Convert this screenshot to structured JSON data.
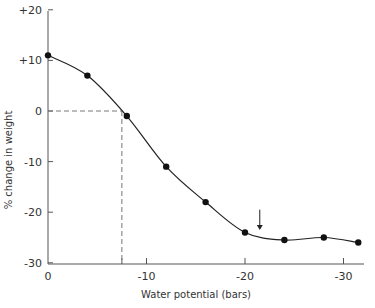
{
  "chart_data": {
    "type": "line",
    "title": "",
    "xlabel": "Water potential (bars)",
    "ylabel": "% change in weight",
    "xlim": [
      0,
      -32
    ],
    "ylim": [
      -30,
      20
    ],
    "grid": false,
    "legend": null,
    "x_ticks": [
      0,
      -10,
      -20,
      -30
    ],
    "x_tick_labels": [
      "0",
      "-10",
      "-20",
      "-30"
    ],
    "y_ticks": [
      20,
      10,
      0,
      -10,
      -20,
      -30
    ],
    "y_tick_labels": [
      "+20",
      "+10",
      "0",
      "-10",
      "-20",
      "-30"
    ],
    "series": [
      {
        "name": "measured",
        "marker": "filled-circle",
        "x": [
          0,
          -4,
          -8,
          -12,
          -16,
          -20,
          -24,
          -28,
          -31.5
        ],
        "y": [
          11,
          7,
          -1,
          -11,
          -18,
          -24,
          -25.5,
          -25,
          -26
        ]
      }
    ],
    "annotations": [
      {
        "type": "dashed-reference",
        "x": -7.5,
        "y": 0,
        "note": "zero weight change at about -7.5 bars"
      },
      {
        "type": "arrow-down",
        "x": -21.5,
        "y_from": -19.5,
        "y_to": -23.5
      }
    ],
    "extra_x_tick": -7.5
  }
}
